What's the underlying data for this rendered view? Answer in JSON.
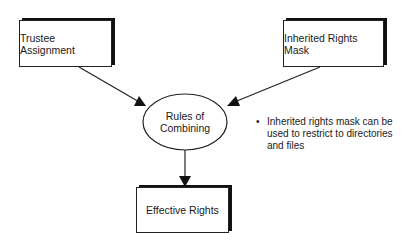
{
  "diagram": {
    "nodes": {
      "trustee": {
        "label": "Trustee Assignment"
      },
      "irm": {
        "label": "Inherited Rights Mask"
      },
      "rules": {
        "line1": "Rules of",
        "line2": "Combining"
      },
      "effective": {
        "label": "Effective Rights"
      }
    },
    "note": {
      "bullet": "•",
      "line1": "Inherited rights mask can be",
      "line2": "used to restrict to directories",
      "line3": "and files"
    },
    "edges": [
      {
        "from": "Trustee Assignment",
        "to": "Rules of Combining"
      },
      {
        "from": "Inherited Rights Mask",
        "to": "Rules of Combining"
      },
      {
        "from": "Rules of Combining",
        "to": "Effective Rights"
      }
    ]
  }
}
